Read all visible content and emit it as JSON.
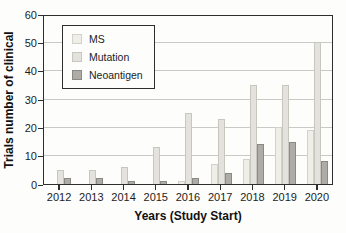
{
  "figure": {
    "background": "#fdfdfc",
    "frame_color": "#2e2e2e",
    "gridline_color": "#c9c9c5"
  },
  "chart_data": {
    "type": "bar",
    "title": "",
    "xlabel": "Years (Study Start)",
    "ylabel": "Trials number of clinical",
    "categories": [
      "2012",
      "2013",
      "2014",
      "2015",
      "2016",
      "2017",
      "2018",
      "2019",
      "2020"
    ],
    "series": [
      {
        "name": "MS",
        "color": "#efeee8",
        "border": "#d2d1ca",
        "values": [
          0,
          0,
          0,
          0,
          1,
          7,
          9,
          20,
          19
        ]
      },
      {
        "name": "Mutation",
        "color": "#e3e2dc",
        "border": "#c7c6bf",
        "values": [
          5,
          5,
          6,
          13,
          25,
          23,
          35,
          35,
          50
        ]
      },
      {
        "name": "Neoantigen",
        "color": "#adaca6",
        "border": "#8a8983",
        "values": [
          2,
          2,
          1,
          1,
          2,
          4,
          14,
          15,
          8
        ]
      }
    ],
    "ylim": [
      0,
      60
    ],
    "yticks": [
      0,
      10,
      20,
      30,
      40,
      50,
      60
    ],
    "grid": "horizontal",
    "legend_position": "top-left"
  }
}
